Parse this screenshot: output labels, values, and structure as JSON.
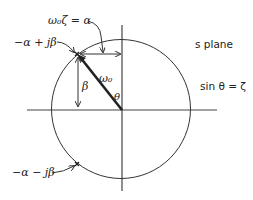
{
  "diagram": {
    "plane_label": "s plane",
    "relation_label": "sin θ = ζ",
    "alpha_relation_label": "ω₀ζ = α",
    "upper_pole_label": "−α + jβ",
    "lower_pole_label": "−α − jβ",
    "radius_label": "ω₀",
    "beta_label": "β",
    "theta_label": "θ",
    "colors": {
      "line": "#333333",
      "text": "#222222",
      "background": "#ffffff"
    }
  }
}
